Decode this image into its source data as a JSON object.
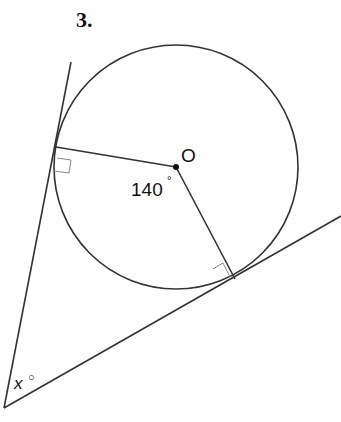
{
  "question_number": "3.",
  "diagram": {
    "center_label": "O",
    "center_angle": "140",
    "center_angle_degree": "°",
    "unknown_angle_var": "x",
    "unknown_angle_degree": "○",
    "stroke_color": "#333333"
  }
}
